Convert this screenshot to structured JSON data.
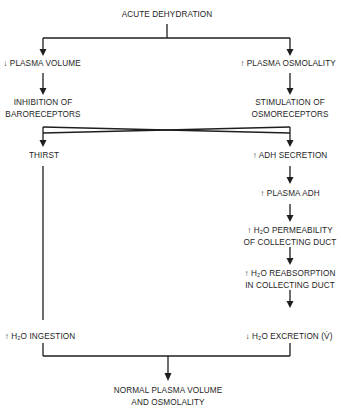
{
  "diagram": {
    "top": "ACUTE DEHYDRATION",
    "left": {
      "n1": "↓ PLASMA VOLUME",
      "n2a": "INHIBITION OF",
      "n2b": "BARORECEPTORS",
      "n3": "THIRST",
      "n4": "↑ H₂O INGESTION"
    },
    "right": {
      "n1": "↑ PLASMA OSMOLALITY",
      "n2a": "STIMULATION OF",
      "n2b": "OSMORECEPTORS",
      "n3": "↑ ADH SECRETION",
      "n4": "↑ PLASMA ADH",
      "n5a": "↑ H₂O PERMEABILITY",
      "n5b": "OF COLLECTING DUCT",
      "n6a": "↑ H₂O REABSORPTION",
      "n6b": "IN COLLECTING DUCT",
      "n7": "↓ H₂O EXCRETION (V̇)"
    },
    "bottom_a": "NORMAL PLASMA VOLUME",
    "bottom_b": "AND OSMOLALITY",
    "line_color": "#1e1e1e"
  }
}
